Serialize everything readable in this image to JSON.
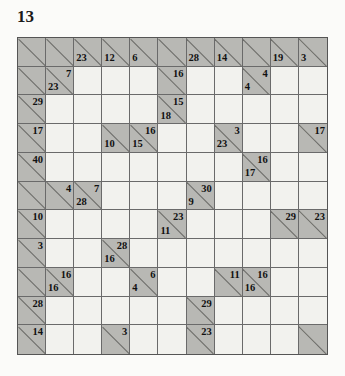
{
  "puzzle": {
    "title": "13",
    "type": "kakuro",
    "rows": 11,
    "cols": 11,
    "colors": {
      "clue_cell": "#b8b8b4",
      "open_cell": "#f2f2ee",
      "grid_line": "#6a6a6a",
      "border": "#555555",
      "text": "#111111",
      "page_background": "#fbfbf9"
    },
    "legend": {
      "down_position": "upper-right",
      "across_position": "lower-left"
    },
    "cells": [
      [
        {
          "t": "clue"
        },
        {
          "t": "clue"
        },
        {
          "t": "clue",
          "across": "23"
        },
        {
          "t": "clue",
          "across": "12"
        },
        {
          "t": "clue",
          "across": "6"
        },
        {
          "t": "clue"
        },
        {
          "t": "clue",
          "across": "28"
        },
        {
          "t": "clue",
          "across": "14"
        },
        {
          "t": "clue"
        },
        {
          "t": "clue",
          "across": "19"
        },
        {
          "t": "clue",
          "across": "3"
        }
      ],
      [
        {
          "t": "clue"
        },
        {
          "t": "clue",
          "down": "7",
          "across": "23"
        },
        {
          "t": "open"
        },
        {
          "t": "open"
        },
        {
          "t": "open"
        },
        {
          "t": "clue",
          "down": "16"
        },
        {
          "t": "open"
        },
        {
          "t": "open"
        },
        {
          "t": "clue",
          "down": "4",
          "across": "4"
        },
        {
          "t": "open"
        },
        {
          "t": "open"
        }
      ],
      [
        {
          "t": "clue",
          "down": "29"
        },
        {
          "t": "open"
        },
        {
          "t": "open"
        },
        {
          "t": "open"
        },
        {
          "t": "open"
        },
        {
          "t": "clue",
          "down": "15",
          "across": "18"
        },
        {
          "t": "open"
        },
        {
          "t": "open"
        },
        {
          "t": "open"
        },
        {
          "t": "open"
        },
        {
          "t": "open"
        }
      ],
      [
        {
          "t": "clue",
          "down": "17"
        },
        {
          "t": "open"
        },
        {
          "t": "open"
        },
        {
          "t": "clue",
          "across": "10"
        },
        {
          "t": "clue",
          "down": "16",
          "across": "15"
        },
        {
          "t": "open"
        },
        {
          "t": "open"
        },
        {
          "t": "clue",
          "down": "3",
          "across": "23"
        },
        {
          "t": "open"
        },
        {
          "t": "open"
        },
        {
          "t": "clue",
          "down": "17"
        }
      ],
      [
        {
          "t": "clue",
          "down": "40"
        },
        {
          "t": "open"
        },
        {
          "t": "open"
        },
        {
          "t": "open"
        },
        {
          "t": "open"
        },
        {
          "t": "open"
        },
        {
          "t": "open"
        },
        {
          "t": "open"
        },
        {
          "t": "clue",
          "down": "16",
          "across": "17"
        },
        {
          "t": "open"
        },
        {
          "t": "open"
        }
      ],
      [
        {
          "t": "clue"
        },
        {
          "t": "clue",
          "down": "4"
        },
        {
          "t": "clue",
          "down": "7",
          "across": "28"
        },
        {
          "t": "open"
        },
        {
          "t": "open"
        },
        {
          "t": "open"
        },
        {
          "t": "clue",
          "down": "30",
          "across": "9"
        },
        {
          "t": "open"
        },
        {
          "t": "open"
        },
        {
          "t": "open"
        },
        {
          "t": "open"
        }
      ],
      [
        {
          "t": "clue",
          "down": "10"
        },
        {
          "t": "open"
        },
        {
          "t": "open"
        },
        {
          "t": "open"
        },
        {
          "t": "open"
        },
        {
          "t": "clue",
          "down": "23",
          "across": "11"
        },
        {
          "t": "open"
        },
        {
          "t": "open"
        },
        {
          "t": "open"
        },
        {
          "t": "clue",
          "down": "29"
        },
        {
          "t": "clue",
          "down": "23"
        }
      ],
      [
        {
          "t": "clue",
          "down": "3"
        },
        {
          "t": "open"
        },
        {
          "t": "open"
        },
        {
          "t": "clue",
          "down": "28",
          "across": "16"
        },
        {
          "t": "open"
        },
        {
          "t": "open"
        },
        {
          "t": "open"
        },
        {
          "t": "open"
        },
        {
          "t": "open"
        },
        {
          "t": "open"
        },
        {
          "t": "open"
        }
      ],
      [
        {
          "t": "clue"
        },
        {
          "t": "clue",
          "down": "16",
          "across": "16"
        },
        {
          "t": "open"
        },
        {
          "t": "open"
        },
        {
          "t": "clue",
          "down": "6",
          "across": "4"
        },
        {
          "t": "open"
        },
        {
          "t": "open"
        },
        {
          "t": "clue",
          "down": "11"
        },
        {
          "t": "clue",
          "down": "16",
          "across": "16"
        },
        {
          "t": "open"
        },
        {
          "t": "open"
        }
      ],
      [
        {
          "t": "clue",
          "down": "28"
        },
        {
          "t": "open"
        },
        {
          "t": "open"
        },
        {
          "t": "open"
        },
        {
          "t": "open"
        },
        {
          "t": "open"
        },
        {
          "t": "clue",
          "down": "29"
        },
        {
          "t": "open"
        },
        {
          "t": "open"
        },
        {
          "t": "open"
        },
        {
          "t": "open"
        }
      ],
      [
        {
          "t": "clue",
          "down": "14"
        },
        {
          "t": "open"
        },
        {
          "t": "open"
        },
        {
          "t": "clue",
          "down": "3"
        },
        {
          "t": "open"
        },
        {
          "t": "open"
        },
        {
          "t": "clue",
          "down": "23"
        },
        {
          "t": "open"
        },
        {
          "t": "open"
        },
        {
          "t": "open"
        },
        {
          "t": "clue"
        }
      ]
    ]
  }
}
